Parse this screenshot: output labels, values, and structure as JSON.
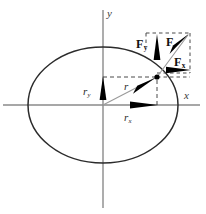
{
  "figure": {
    "colors": {
      "background": "#ffffff",
      "ellipse": "#2b2b2b",
      "axis": "#8a8a8a",
      "vector_line": "#9a9a9a",
      "arrow_fill": "#000000",
      "dashed": "#4a4a4a",
      "label": "#1a1a1a"
    }
  },
  "axes": {
    "x_label": "x",
    "y_label": "y",
    "origin_label": ""
  },
  "ellipse": {
    "center_x": 103,
    "center_y": 105,
    "semi_major": 75,
    "semi_minor": 58
  },
  "point": {
    "x": 157,
    "y": 77,
    "label": ""
  },
  "vectors": [
    {
      "name": "position-vector",
      "label": "r",
      "subscript": "",
      "label_x": 124,
      "label_y": 81,
      "description": "position vector from origin to point on ellipse"
    },
    {
      "name": "position-component-y",
      "label": "r",
      "subscript": "y",
      "label_x": 83,
      "label_y": 86,
      "description": "vertical component of position vector"
    },
    {
      "name": "position-component-x",
      "label": "r",
      "subscript": "x",
      "label_x": 124,
      "label_y": 112,
      "description": "horizontal component of position vector"
    },
    {
      "name": "force-vector",
      "label": "F",
      "subscript": "",
      "label_x": 166,
      "label_y": 36,
      "description": "force vector at the point on the ellipse"
    },
    {
      "name": "force-component-y",
      "label": "F",
      "subscript": "y",
      "label_x": 136,
      "label_y": 38,
      "description": "vertical component of force vector"
    },
    {
      "name": "force-component-x",
      "label": "F",
      "subscript": "x",
      "label_x": 174,
      "label_y": 56,
      "description": "horizontal component of force vector"
    }
  ]
}
